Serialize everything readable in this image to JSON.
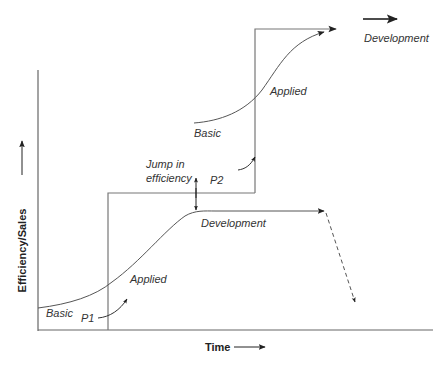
{
  "diagram": {
    "type": "s-curve-technology-jumps",
    "axes": {
      "y_label": "Efficiency/Sales",
      "x_label": "Time"
    },
    "colors": {
      "line": "#555555",
      "axis": "#666666",
      "text": "#333333"
    },
    "curve_1": {
      "labels": {
        "basic": "Basic",
        "applied": "Applied",
        "development": "Development"
      },
      "point_label": "P1",
      "decline": "dashed-arrow"
    },
    "curve_2": {
      "labels": {
        "basic": "Basic",
        "applied": "Applied",
        "development": "Development"
      },
      "point_label": "P2"
    },
    "jump_label_line1": "Jump in",
    "jump_label_line2": "efficiency"
  }
}
